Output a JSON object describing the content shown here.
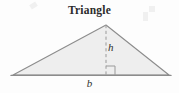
{
  "figure": {
    "title": "Triangle",
    "shape": "triangle",
    "background_color": "#fdfdfd",
    "fill_color": "#eeeeee",
    "stroke_color": "#8c8c8c",
    "dash_color": "#9a9a9a",
    "label_color": "#303030",
    "title_color": "#2b2b2b",
    "labels": {
      "height": "h",
      "base": "b"
    },
    "geometry": {
      "left_vertex": [
        13,
        75
      ],
      "right_vertex": [
        169,
        75
      ],
      "apex": [
        106,
        25
      ],
      "altitude_foot": [
        106,
        75
      ],
      "right_angle_marker_size": 9,
      "base_length_px": 156,
      "height_length_px": 50
    }
  }
}
